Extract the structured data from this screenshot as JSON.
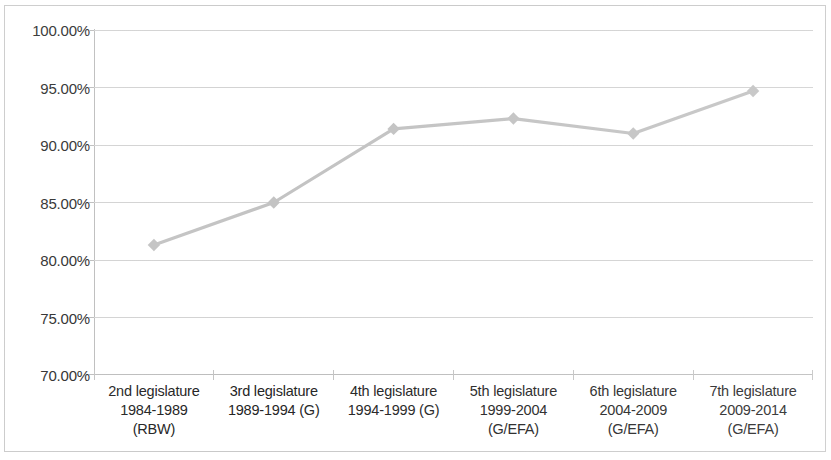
{
  "chart_data": {
    "type": "line",
    "title": "",
    "subtitle": "",
    "xlabel": "",
    "ylabel": "",
    "categories": [
      "2nd legislature\n1984-1989\n(RBW)",
      "3rd legislature\n1989-1994 (G)",
      "4th legislature\n1994-1999 (G)",
      "5th legislature\n1999-2004\n(G/EFA)",
      "6th legislature\n2004-2009\n(G/EFA)",
      "7th legislature\n2009-2014\n(G/EFA)"
    ],
    "values": [
      81.3,
      85.0,
      91.4,
      92.3,
      91.0,
      94.7
    ],
    "value_labels": [
      "81.30%",
      "85.00%",
      "91.40%",
      "92.30%",
      "91.00%",
      "94.70%"
    ],
    "ylim": [
      70,
      100
    ],
    "ytick_values": [
      100,
      95,
      90,
      85,
      80,
      75,
      70
    ],
    "ytick_labels": [
      "100.00%",
      "95.00%",
      "90.00%",
      "85.00%",
      "80.00%",
      "75.00%",
      "70.00%"
    ],
    "grid": true,
    "legend": false,
    "legend_position": "none",
    "series_color": "#c3c3c3",
    "grid_color": "#d2d2d2",
    "axis_color": "#bdbdbd",
    "text_color": "#2b2b2b",
    "marker": "diamond"
  }
}
